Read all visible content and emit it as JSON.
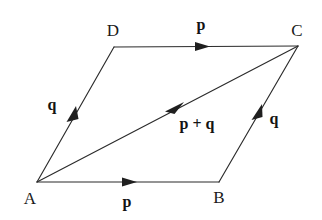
{
  "figure": {
    "background_color": "#ffffff",
    "line_color": "#2b2b2b",
    "text_color": "#1a1a1a",
    "width": 322,
    "height": 220
  },
  "vertices": [
    {
      "id": "A",
      "label": "A",
      "x": 37,
      "y": 182,
      "label_x": 30,
      "label_y": 204
    },
    {
      "id": "B",
      "label": "B",
      "x": 219,
      "y": 182,
      "label_x": 219,
      "label_y": 203
    },
    {
      "id": "C",
      "label": "C",
      "x": 298,
      "y": 46,
      "label_x": 297,
      "label_y": 36
    },
    {
      "id": "D",
      "label": "D",
      "x": 114,
      "y": 47,
      "label_x": 113,
      "label_y": 36
    }
  ],
  "edges": [
    {
      "id": "AB",
      "from": "A",
      "to": "B",
      "vector": "p",
      "arrow_t": 0.5
    },
    {
      "id": "DC",
      "from": "D",
      "to": "C",
      "vector": "p",
      "arrow_t": 0.48
    },
    {
      "id": "AD",
      "from": "A",
      "to": "D",
      "vector": "q",
      "arrow_t": 0.47
    },
    {
      "id": "BC",
      "from": "B",
      "to": "C",
      "vector": "q",
      "arrow_t": 0.5
    },
    {
      "id": "AC",
      "from": "A",
      "to": "C",
      "vector": "p + q",
      "arrow_t": 0.53
    }
  ],
  "vector_labels": [
    {
      "id": "p-bottom",
      "text": "p",
      "x": 127,
      "y": 207,
      "anchor": "middle"
    },
    {
      "id": "p-top",
      "text": "p",
      "x": 201,
      "y": 30,
      "anchor": "middle"
    },
    {
      "id": "q-left",
      "text": "q",
      "x": 52,
      "y": 110,
      "anchor": "middle"
    },
    {
      "id": "q-right",
      "text": "q",
      "x": 274,
      "y": 124,
      "anchor": "middle"
    },
    {
      "id": "p-plus-q",
      "text": "p + q",
      "x": 197,
      "y": 129,
      "anchor": "middle"
    }
  ]
}
